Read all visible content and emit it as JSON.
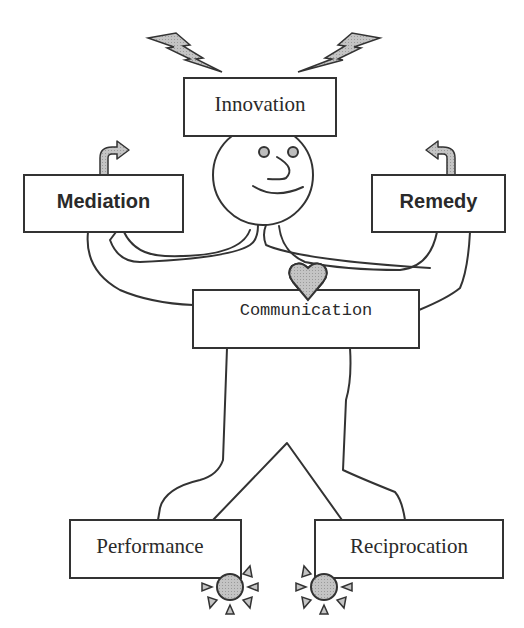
{
  "diagram": {
    "title": "",
    "figure": "stick-figure",
    "boxes": {
      "innovation": {
        "label": "Innovation",
        "position": "head-top",
        "icon": "lightning-bolts-icon"
      },
      "mediation": {
        "label": "Mediation",
        "position": "left-hand",
        "icon": "curved-arrow-right-icon"
      },
      "remedy": {
        "label": "Remedy",
        "position": "right-hand",
        "icon": "curved-arrow-left-icon"
      },
      "communication": {
        "label": "Communication",
        "position": "chest",
        "icon": "heart-icon"
      },
      "performance": {
        "label": "Performance",
        "position": "left-foot",
        "icon": "sun-icon"
      },
      "reciprocation": {
        "label": "Reciprocation",
        "position": "right-foot",
        "icon": "sun-icon"
      }
    },
    "colors": {
      "stroke": "#333333",
      "icon_fill": "#bdbdbd",
      "box_fill": "#ffffff",
      "background": "#ffffff"
    }
  }
}
